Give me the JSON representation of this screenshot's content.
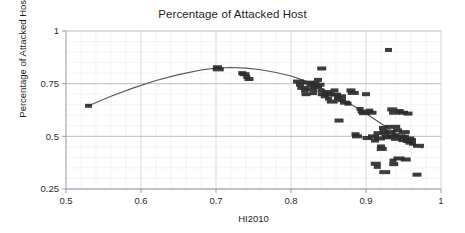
{
  "chart_data": {
    "type": "scatter",
    "title": "Percentage of Attacked Host",
    "xlabel": "HI2010",
    "ylabel": "Percentage of Attacked Host",
    "xlim": [
      0.5,
      1.0
    ],
    "ylim": [
      0.25,
      1.0
    ],
    "xticks": [
      "0.5",
      "0.6",
      "0.7",
      "0.8",
      "0.9",
      "1"
    ],
    "xtick_values": [
      0.5,
      0.6,
      0.7,
      0.8,
      0.9,
      1.0
    ],
    "yticks": [
      "0.25",
      "0.5",
      "0.75",
      "1"
    ],
    "ytick_values": [
      0.25,
      0.5,
      0.75,
      1.0
    ],
    "grid": true,
    "minor_grid": true,
    "legend": "none",
    "marker_color": "#2b2b2b",
    "marker_shape": "square",
    "trendline": {
      "name": "fitted smooth curve",
      "color": "#555555",
      "x": [
        0.53,
        0.56,
        0.59,
        0.62,
        0.65,
        0.68,
        0.7,
        0.72,
        0.74,
        0.76,
        0.78,
        0.8,
        0.82,
        0.84,
        0.86,
        0.88,
        0.9,
        0.92,
        0.94,
        0.96,
        0.975
      ],
      "y": [
        0.645,
        0.69,
        0.73,
        0.765,
        0.793,
        0.815,
        0.824,
        0.827,
        0.824,
        0.816,
        0.803,
        0.786,
        0.762,
        0.729,
        0.692,
        0.652,
        0.608,
        0.561,
        0.513,
        0.468,
        0.445
      ]
    },
    "points": [
      {
        "x": 0.53,
        "y": 0.645
      },
      {
        "x": 0.702,
        "y": 0.828
      },
      {
        "x": 0.703,
        "y": 0.818
      },
      {
        "x": 0.735,
        "y": 0.8
      },
      {
        "x": 0.738,
        "y": 0.795
      },
      {
        "x": 0.741,
        "y": 0.782
      },
      {
        "x": 0.744,
        "y": 0.772
      },
      {
        "x": 0.81,
        "y": 0.76
      },
      {
        "x": 0.812,
        "y": 0.745
      },
      {
        "x": 0.815,
        "y": 0.73
      },
      {
        "x": 0.818,
        "y": 0.718
      },
      {
        "x": 0.82,
        "y": 0.7
      },
      {
        "x": 0.824,
        "y": 0.755
      },
      {
        "x": 0.826,
        "y": 0.74
      },
      {
        "x": 0.828,
        "y": 0.722
      },
      {
        "x": 0.83,
        "y": 0.705
      },
      {
        "x": 0.832,
        "y": 0.752
      },
      {
        "x": 0.834,
        "y": 0.735
      },
      {
        "x": 0.836,
        "y": 0.768
      },
      {
        "x": 0.838,
        "y": 0.745
      },
      {
        "x": 0.84,
        "y": 0.718
      },
      {
        "x": 0.841,
        "y": 0.822
      },
      {
        "x": 0.843,
        "y": 0.7
      },
      {
        "x": 0.845,
        "y": 0.69
      },
      {
        "x": 0.848,
        "y": 0.71
      },
      {
        "x": 0.85,
        "y": 0.68
      },
      {
        "x": 0.852,
        "y": 0.7
      },
      {
        "x": 0.855,
        "y": 0.665
      },
      {
        "x": 0.858,
        "y": 0.718
      },
      {
        "x": 0.86,
        "y": 0.698
      },
      {
        "x": 0.862,
        "y": 0.68
      },
      {
        "x": 0.864,
        "y": 0.575
      },
      {
        "x": 0.866,
        "y": 0.69
      },
      {
        "x": 0.868,
        "y": 0.672
      },
      {
        "x": 0.872,
        "y": 0.66
      },
      {
        "x": 0.876,
        "y": 0.655
      },
      {
        "x": 0.88,
        "y": 0.718
      },
      {
        "x": 0.883,
        "y": 0.706
      },
      {
        "x": 0.886,
        "y": 0.51
      },
      {
        "x": 0.888,
        "y": 0.5
      },
      {
        "x": 0.892,
        "y": 0.63
      },
      {
        "x": 0.895,
        "y": 0.618
      },
      {
        "x": 0.898,
        "y": 0.61
      },
      {
        "x": 0.9,
        "y": 0.7
      },
      {
        "x": 0.902,
        "y": 0.492
      },
      {
        "x": 0.905,
        "y": 0.622
      },
      {
        "x": 0.908,
        "y": 0.612
      },
      {
        "x": 0.91,
        "y": 0.5
      },
      {
        "x": 0.912,
        "y": 0.48
      },
      {
        "x": 0.913,
        "y": 0.37
      },
      {
        "x": 0.915,
        "y": 0.355
      },
      {
        "x": 0.916,
        "y": 0.515
      },
      {
        "x": 0.918,
        "y": 0.49
      },
      {
        "x": 0.92,
        "y": 0.452
      },
      {
        "x": 0.921,
        "y": 0.44
      },
      {
        "x": 0.922,
        "y": 0.54
      },
      {
        "x": 0.924,
        "y": 0.525
      },
      {
        "x": 0.925,
        "y": 0.33
      },
      {
        "x": 0.926,
        "y": 0.508
      },
      {
        "x": 0.928,
        "y": 0.495
      },
      {
        "x": 0.93,
        "y": 0.91
      },
      {
        "x": 0.931,
        "y": 0.545
      },
      {
        "x": 0.932,
        "y": 0.52
      },
      {
        "x": 0.934,
        "y": 0.5
      },
      {
        "x": 0.935,
        "y": 0.628
      },
      {
        "x": 0.936,
        "y": 0.385
      },
      {
        "x": 0.937,
        "y": 0.368
      },
      {
        "x": 0.938,
        "y": 0.612
      },
      {
        "x": 0.939,
        "y": 0.505
      },
      {
        "x": 0.94,
        "y": 0.488
      },
      {
        "x": 0.941,
        "y": 0.545
      },
      {
        "x": 0.942,
        "y": 0.528
      },
      {
        "x": 0.944,
        "y": 0.395
      },
      {
        "x": 0.945,
        "y": 0.62
      },
      {
        "x": 0.946,
        "y": 0.5
      },
      {
        "x": 0.948,
        "y": 0.482
      },
      {
        "x": 0.95,
        "y": 0.612
      },
      {
        "x": 0.951,
        "y": 0.52
      },
      {
        "x": 0.952,
        "y": 0.498
      },
      {
        "x": 0.953,
        "y": 0.39
      },
      {
        "x": 0.954,
        "y": 0.478
      },
      {
        "x": 0.956,
        "y": 0.608
      },
      {
        "x": 0.957,
        "y": 0.49
      },
      {
        "x": 0.958,
        "y": 0.47
      },
      {
        "x": 0.96,
        "y": 0.482
      },
      {
        "x": 0.962,
        "y": 0.465
      },
      {
        "x": 0.968,
        "y": 0.318
      },
      {
        "x": 0.97,
        "y": 0.455
      }
    ]
  }
}
